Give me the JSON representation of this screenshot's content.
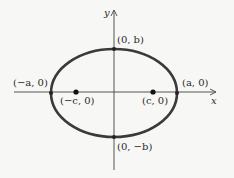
{
  "diagram": {
    "type": "ellipse-with-foci",
    "axes": {
      "x_label": "x",
      "y_label": "y"
    },
    "colors": {
      "curve": "#3a3a3a",
      "axis": "#555555",
      "background": "#f7f7f5"
    },
    "points": {
      "top_vertex": "(0, b)",
      "bottom_vertex": "(0, −b)",
      "left_vertex": "(−a, 0)",
      "right_vertex": "(a, 0)",
      "left_focus": "(−c, 0)",
      "right_focus": "(c, 0)"
    }
  }
}
